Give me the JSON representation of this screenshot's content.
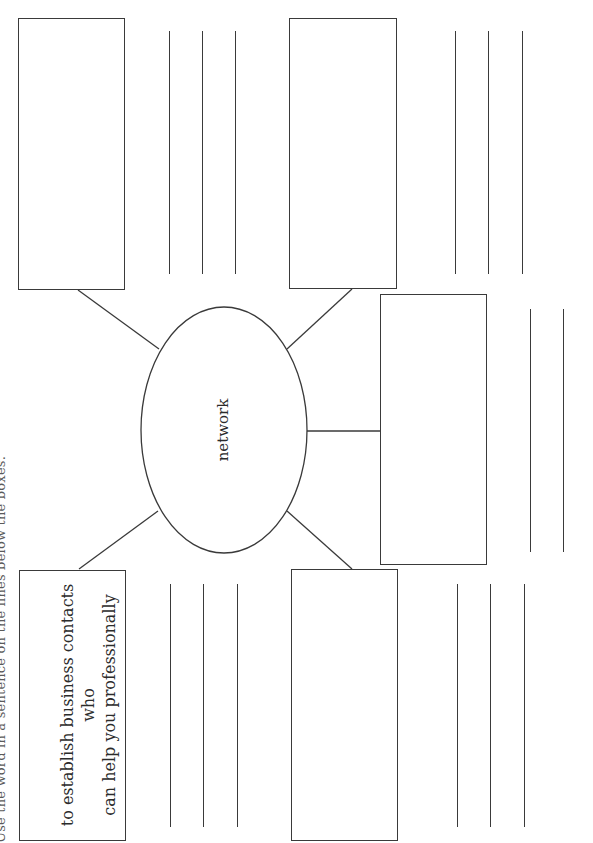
{
  "worksheet": {
    "instruction_partial": "Use the word in a sentence on the lines below the boxes.",
    "center_word": "network",
    "definition": "to establish business contacts who can help you professionally",
    "definition_lines": [
      "to establish business contacts who",
      "can help you professionally"
    ],
    "boxes": [
      {
        "id": "definition-box",
        "content": "to establish business contacts who can help you professionally"
      },
      {
        "id": "box-2",
        "content": ""
      },
      {
        "id": "box-3",
        "content": ""
      },
      {
        "id": "box-4",
        "content": ""
      },
      {
        "id": "box-5",
        "content": ""
      }
    ],
    "writing_line_groups": [
      {
        "under": "definition-box",
        "count": 3
      },
      {
        "under": "box-2",
        "count": 3
      },
      {
        "under": "box-3",
        "count": 3
      },
      {
        "under": "box-4",
        "count": 3
      },
      {
        "under": "box-5",
        "count": 2
      }
    ]
  },
  "colors": {
    "stroke": "#3a3a3a",
    "text": "#2b2b2b",
    "background": "#ffffff"
  }
}
